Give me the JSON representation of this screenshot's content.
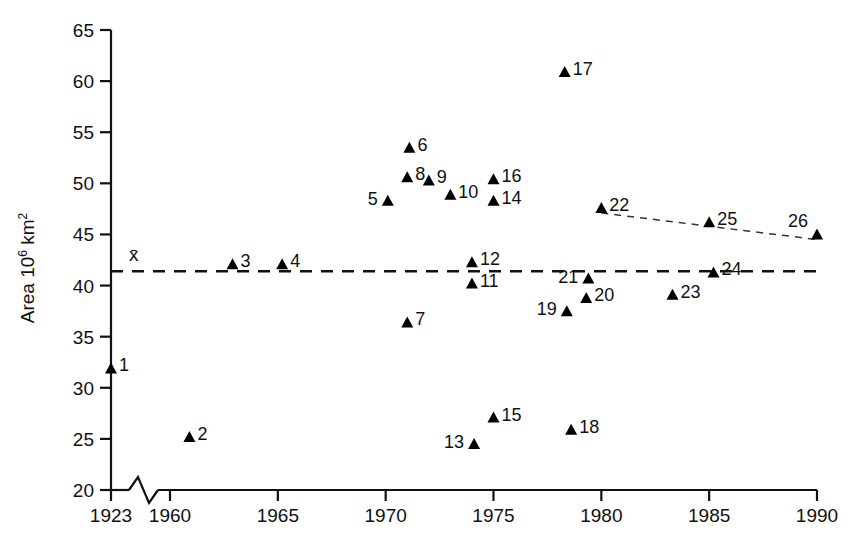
{
  "chart_data": {
    "type": "scatter",
    "title": "",
    "xlabel": "",
    "ylabel": "Area 10⁶ km²",
    "ylabel_base": "Area 10",
    "ylabel_exp1": "6",
    "ylabel_unit": " km",
    "ylabel_exp2": "2",
    "xlim": [
      1923,
      1990
    ],
    "ylim": [
      20,
      65
    ],
    "axis_break": true,
    "axis_break_note": "zig-zag break on x-axis between 1923 and 1960",
    "grid": false,
    "legend": false,
    "y_ticks": [
      "65",
      "60",
      "55",
      "50",
      "45",
      "40",
      "35",
      "30",
      "25",
      "20"
    ],
    "y_tick_values": [
      65,
      60,
      55,
      50,
      45,
      40,
      35,
      30,
      25,
      20
    ],
    "x_ticks": [
      "1923",
      "1960",
      "1965",
      "1970",
      "1975",
      "1980",
      "1985",
      "1990"
    ],
    "x_tick_values": [
      1923,
      1960,
      1965,
      1970,
      1975,
      1980,
      1985,
      1990
    ],
    "mean_line": {
      "label": "x̄",
      "value": 41.4,
      "style": "dashed",
      "spans_full_width": true
    },
    "trend_line": {
      "style": "dashed-thin",
      "connects": [
        22,
        25,
        26
      ],
      "from": {
        "x": 1980,
        "y": 47.1
      },
      "to": {
        "x": 1990,
        "y": 44.5
      }
    },
    "marker": "filled-triangle",
    "points": [
      {
        "id": "1",
        "x": 1923,
        "y": 31.4,
        "label_pos": "right"
      },
      {
        "id": "2",
        "x": 1960.9,
        "y": 24.7,
        "label_pos": "right"
      },
      {
        "id": "3",
        "x": 1962.9,
        "y": 41.6,
        "label_pos": "right"
      },
      {
        "id": "4",
        "x": 1965.2,
        "y": 41.6,
        "label_pos": "right"
      },
      {
        "id": "5",
        "x": 1970.1,
        "y": 47.8,
        "label_pos": "left"
      },
      {
        "id": "6",
        "x": 1971.1,
        "y": 53.0,
        "label_pos": "right"
      },
      {
        "id": "7",
        "x": 1971.0,
        "y": 35.9,
        "label_pos": "right"
      },
      {
        "id": "8",
        "x": 1971.0,
        "y": 50.1,
        "label_pos": "right"
      },
      {
        "id": "9",
        "x": 1972.0,
        "y": 49.8,
        "label_pos": "right"
      },
      {
        "id": "10",
        "x": 1973.0,
        "y": 48.4,
        "label_pos": "right"
      },
      {
        "id": "11",
        "x": 1974.0,
        "y": 39.7,
        "label_pos": "right"
      },
      {
        "id": "12",
        "x": 1974.0,
        "y": 41.8,
        "label_pos": "right"
      },
      {
        "id": "13",
        "x": 1974.1,
        "y": 24.0,
        "label_pos": "left"
      },
      {
        "id": "14",
        "x": 1975.0,
        "y": 47.8,
        "label_pos": "right"
      },
      {
        "id": "15",
        "x": 1975.0,
        "y": 26.6,
        "label_pos": "right"
      },
      {
        "id": "16",
        "x": 1975.0,
        "y": 49.9,
        "label_pos": "right"
      },
      {
        "id": "17",
        "x": 1978.3,
        "y": 60.4,
        "label_pos": "right"
      },
      {
        "id": "18",
        "x": 1978.6,
        "y": 25.4,
        "label_pos": "right"
      },
      {
        "id": "19",
        "x": 1978.4,
        "y": 37.0,
        "label_pos": "left"
      },
      {
        "id": "20",
        "x": 1979.3,
        "y": 38.3,
        "label_pos": "right"
      },
      {
        "id": "21",
        "x": 1979.4,
        "y": 40.2,
        "label_pos": "left"
      },
      {
        "id": "22",
        "x": 1980.0,
        "y": 47.1,
        "label_pos": "right"
      },
      {
        "id": "23",
        "x": 1983.3,
        "y": 38.6,
        "label_pos": "right"
      },
      {
        "id": "24",
        "x": 1985.2,
        "y": 40.8,
        "label_pos": "right"
      },
      {
        "id": "25",
        "x": 1985.0,
        "y": 45.7,
        "label_pos": "right"
      },
      {
        "id": "26",
        "x": 1990.0,
        "y": 44.5,
        "label_pos": "upleft"
      }
    ]
  },
  "colors": {
    "axis": "#111111",
    "marker": "#000000",
    "mean_line": "#111111",
    "trend_line": "#333333",
    "background": "#ffffff"
  }
}
